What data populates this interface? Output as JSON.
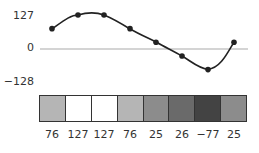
{
  "chart_data": {
    "type": "line",
    "title": "",
    "xlabel": "",
    "ylabel": "",
    "ylim": [
      -128,
      127
    ],
    "y_ticks": [
      "127",
      "0",
      "-128"
    ],
    "x": [
      1,
      2,
      3,
      4,
      5,
      6,
      7,
      8
    ],
    "series": [
      {
        "name": "signal",
        "values": [
          76,
          127,
          127,
          76,
          25,
          -26,
          -77,
          25
        ]
      }
    ],
    "grayscale_strip": {
      "labels": [
        "76",
        "127",
        "127",
        "76",
        "25",
        "26",
        "−77",
        "25"
      ],
      "colors": [
        "#b5b5b5",
        "#ffffff",
        "#ffffff",
        "#b5b5b5",
        "#8c8c8c",
        "#6a6a6a",
        "#434343",
        "#8c8c8c"
      ]
    }
  },
  "axis": {
    "top_label": "127",
    "zero_label": "0",
    "bottom_label": "−128"
  },
  "strip": {
    "cells": [
      {
        "value": "76",
        "color": "#b5b5b5"
      },
      {
        "value": "127",
        "color": "#ffffff"
      },
      {
        "value": "127",
        "color": "#ffffff"
      },
      {
        "value": "76",
        "color": "#b5b5b5"
      },
      {
        "value": "25",
        "color": "#8c8c8c"
      },
      {
        "value": "26",
        "color": "#6a6a6a"
      },
      {
        "value": "−77",
        "color": "#434343"
      },
      {
        "value": "25",
        "color": "#8c8c8c"
      }
    ]
  },
  "colors": {
    "curve": "#222222",
    "zero_line": "#aaaaaa",
    "border": "#333333"
  }
}
